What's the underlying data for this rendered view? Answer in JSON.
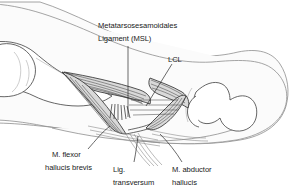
{
  "figure": {
    "kind": "anatomical-line-drawing",
    "background_color": "#ffffff",
    "line_color": "#2b2b2b",
    "soft_tissue_color": "#fbfbfb",
    "ligament_fill_color": "#d9d9d9"
  },
  "labels": {
    "msl": {
      "line1": "Metatarsosesamoidales",
      "line2": "Ligament (MSL)"
    },
    "lcl": {
      "line1": "LCL"
    },
    "flexor": {
      "line1": "M. flexor",
      "line2": "hallucis brevis"
    },
    "transversum": {
      "line1": "Lig.",
      "line2": "transversum"
    },
    "abductor": {
      "line1": "M. abductor",
      "line2": "hallucis"
    }
  }
}
